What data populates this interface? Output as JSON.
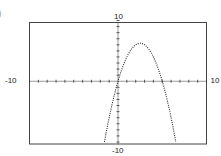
{
  "panel_label_partial": ")",
  "chart_data": {
    "type": "line",
    "title": "",
    "xlabel": "",
    "ylabel": "",
    "xlim": [
      -10,
      10
    ],
    "ylim": [
      -10,
      10
    ],
    "grid": false,
    "style": "dotted graphing-calculator plot with tick marks every 1 unit on both axes",
    "function": "y = -x^2 + 5x",
    "tick_labels": {
      "x_min": "-10",
      "x_max": "10",
      "y_min": "-10",
      "y_max": "10"
    },
    "key_points": {
      "vertex": [
        2.5,
        6.25
      ],
      "roots": [
        0,
        5
      ],
      "exits_bottom_at_x": [
        -1.53,
        6.53
      ]
    },
    "series": [
      {
        "name": "parabola",
        "x": [
          -1.5,
          -1,
          -0.5,
          0,
          0.5,
          1,
          1.5,
          2,
          2.5,
          3,
          3.5,
          4,
          4.5,
          5,
          5.5,
          6,
          6.5
        ],
        "y": [
          -9.75,
          -6,
          -2.75,
          0,
          2.25,
          4,
          5.25,
          6,
          6.25,
          6,
          5.25,
          4,
          2.25,
          0,
          -2.75,
          -6,
          -9.75
        ]
      }
    ]
  }
}
